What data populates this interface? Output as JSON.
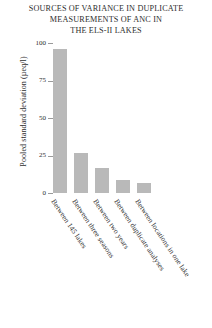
{
  "chart_data": {
    "type": "bar",
    "title": "SOURCES OF VARIANCE IN DUPLICATE MEASUREMENTS OF ANC IN THE ELS-II LAKES",
    "title_lines": [
      "SOURCES OF VARIANCE IN DUPLICATE",
      "MEASUREMENTS OF ANC IN",
      "THE ELS-II LAKES"
    ],
    "categories": [
      "Between 145 lakes",
      "Between three seasons",
      "Between two years",
      "Between duplicate analyses",
      "Between locations in one lake"
    ],
    "values": [
      96,
      27,
      17,
      9,
      7
    ],
    "xlabel": "",
    "ylabel": "Pooled standard deviation (µeq/l)",
    "ylim": [
      0,
      100
    ],
    "yticks": [
      0,
      25,
      50,
      75,
      100
    ],
    "ytick_labels": [
      "0",
      "25",
      "50",
      "75",
      "100"
    ],
    "grid": false,
    "legend": false,
    "bar_color": "#b9b9b9",
    "background_color": "#ffffff",
    "text_color": "#2e2e2e"
  }
}
